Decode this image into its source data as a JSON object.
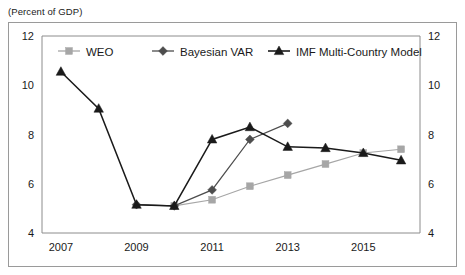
{
  "unit_label": "(Percent of GDP)",
  "legend": {
    "position": "top-center-inside",
    "items": [
      {
        "label": "WEO",
        "marker": "square",
        "color": "#a6a6a6"
      },
      {
        "label": "Bayesian VAR",
        "marker": "diamond",
        "color": "#4d4d4d"
      },
      {
        "label": "IMF Multi-Country Model",
        "marker": "triangle",
        "color": "#1a1a1a"
      }
    ]
  },
  "chart_data": {
    "type": "line",
    "title": "",
    "subtitle": "",
    "xlabel": "",
    "ylabel": "",
    "unit": "Percent of GDP",
    "grid": false,
    "x": [
      2007,
      2008,
      2009,
      2010,
      2011,
      2012,
      2013,
      2014,
      2015,
      2016
    ],
    "xtick_labels": [
      "2007",
      "2009",
      "2011",
      "2013",
      "2015"
    ],
    "xtick_values": [
      2007,
      2009,
      2011,
      2013,
      2015
    ],
    "xlim": [
      2006.5,
      2016.5
    ],
    "ytick_labels_left": [
      "12",
      "10",
      "8",
      "6",
      "4"
    ],
    "ytick_labels_right": [
      "12",
      "10",
      "8",
      "6",
      "4"
    ],
    "ytick_values": [
      12,
      10,
      8,
      6,
      4
    ],
    "ylim": [
      4,
      12
    ],
    "series": [
      {
        "name": "WEO",
        "marker": "square",
        "color": "#a6a6a6",
        "x": [
          2010,
          2011,
          2012,
          2013,
          2014,
          2015,
          2016
        ],
        "values": [
          5.1,
          5.35,
          5.9,
          6.35,
          6.8,
          7.25,
          7.4
        ]
      },
      {
        "name": "Bayesian VAR",
        "marker": "diamond",
        "color": "#4d4d4d",
        "x": [
          2009,
          2010,
          2011,
          2012,
          2013
        ],
        "values": [
          5.15,
          5.1,
          5.75,
          7.8,
          8.45
        ]
      },
      {
        "name": "IMF Multi-Country Model",
        "marker": "triangle",
        "color": "#1a1a1a",
        "x": [
          2007,
          2008,
          2009,
          2010,
          2011,
          2012,
          2013,
          2014,
          2015,
          2016
        ],
        "values": [
          10.55,
          9.05,
          5.15,
          5.1,
          7.8,
          8.3,
          7.5,
          7.45,
          7.25,
          6.95
        ]
      }
    ]
  }
}
